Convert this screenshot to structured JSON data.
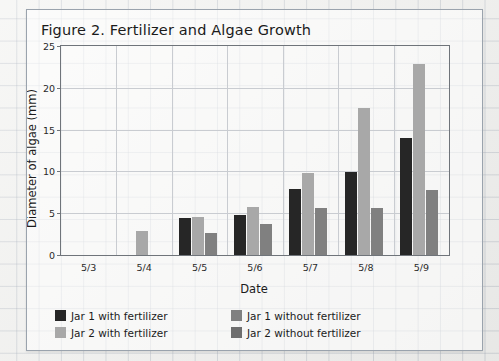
{
  "figure": {
    "title": "Figure 2. Fertilizer and Algae Growth"
  },
  "chart_data": {
    "type": "bar",
    "title": "Figure 2. Fertilizer and Algae Growth",
    "xlabel": "Date",
    "ylabel": "Diameter of algae (mm)",
    "categories": [
      "5/3",
      "5/4",
      "5/5",
      "5/6",
      "5/7",
      "5/8",
      "5/9"
    ],
    "ylim": [
      0,
      25
    ],
    "yticks": [
      0,
      5,
      10,
      15,
      20,
      25
    ],
    "grid": true,
    "legend_position": "bottom",
    "series": [
      {
        "name": "Jar 1 with fertilizer",
        "color": "#262626",
        "values": [
          0,
          0,
          4.4,
          4.8,
          7.9,
          9.9,
          14.0
        ]
      },
      {
        "name": "Jar 1 without fertilizer",
        "color": "#808080",
        "values": [
          0,
          0,
          2.6,
          3.7,
          5.6,
          5.6,
          7.8
        ]
      },
      {
        "name": "Jar 2 with fertilizer",
        "color": "#a8a8a8",
        "values": [
          0,
          2.9,
          4.6,
          5.8,
          9.8,
          17.6,
          22.8
        ]
      },
      {
        "name": "Jar 2 without fertilizer",
        "color": "#6e6e6e",
        "values": [
          0,
          0,
          0,
          0,
          0,
          0,
          0
        ]
      }
    ]
  },
  "legend": {
    "items": [
      {
        "label": "Jar 1 with fertilizer",
        "color": "#262626"
      },
      {
        "label": "Jar 1 without fertilizer",
        "color": "#808080"
      },
      {
        "label": "Jar 2 with fertilizer",
        "color": "#a8a8a8"
      },
      {
        "label": "Jar 2 without fertilizer",
        "color": "#6e6e6e"
      }
    ]
  }
}
